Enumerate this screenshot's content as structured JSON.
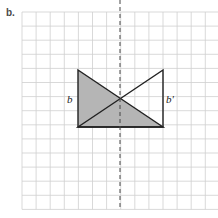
{
  "figure": {
    "label": "b.",
    "grid": {
      "x0": 22,
      "y0": 12,
      "cell": 14.1,
      "cols": 14,
      "rows": 14,
      "line_color": "#cfcfcf"
    },
    "axis_of_symmetry": {
      "style": "dashed",
      "x": 120,
      "color": "#444444"
    },
    "shaded_triangle": {
      "fill": "#b5b5b5",
      "stroke": "#222222",
      "points": [
        [
          78,
          70
        ],
        [
          78,
          127
        ],
        [
          163,
          127
        ]
      ],
      "label": "b"
    },
    "reflected_triangle": {
      "fill": "none",
      "stroke": "#222222",
      "points": [
        [
          163,
          70
        ],
        [
          163,
          127
        ],
        [
          78,
          127
        ]
      ],
      "label": "b'"
    },
    "labels": {
      "left": "b",
      "right": "b'"
    }
  }
}
